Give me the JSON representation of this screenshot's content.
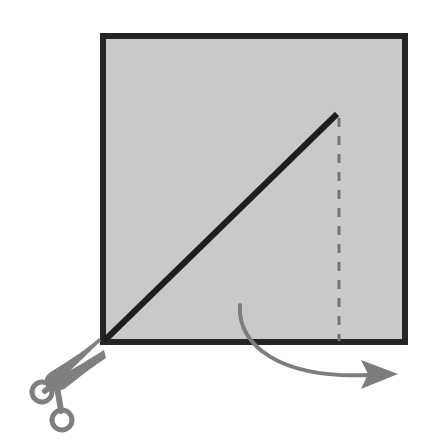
{
  "figure": {
    "name": "paper-fold-and-cut-instruction",
    "type": "diagram",
    "canvas": {
      "width": 423,
      "height": 446,
      "background": "#ffffff"
    }
  },
  "paper_sheet": {
    "shape": "square",
    "fill_color": "#c9c9c9",
    "stroke_color": "#242424",
    "stroke_width": 6,
    "x": 103,
    "y": 36,
    "width": 302,
    "height": 306
  },
  "cut_line": {
    "label": "diagonal cut line",
    "color": "#1e1e1e",
    "stroke_width": 6,
    "from": {
      "x": 104,
      "y": 341
    },
    "to": {
      "x": 337,
      "y": 114
    }
  },
  "fold_line": {
    "label": "dashed fold line",
    "color": "#757575",
    "stroke_width": 3,
    "dash": "9 9",
    "from": {
      "x": 339,
      "y": 118
    },
    "to": {
      "x": 339,
      "y": 341
    }
  },
  "motion_arrow": {
    "label": "fold direction arrow",
    "color": "#7d7d7d",
    "stroke_width": 4,
    "path": "M 240,305 C 238,345 280,378 370,375",
    "arrowhead": {
      "tip": {
        "x": 398,
        "y": 374
      },
      "points": "398,374 361,360 368,374 361,389"
    }
  },
  "scissors": {
    "label": "scissors",
    "icon": "scissors-icon",
    "color": "#7f7f7f",
    "ring_upper": {
      "cx": 42,
      "cy": 392,
      "r": 10,
      "stroke_width": 5
    },
    "ring_lower": {
      "cx": 62,
      "cy": 420,
      "r": 10,
      "stroke_width": 5
    },
    "blade_upper": "M 48,385 C 58,377 68,368 100,343",
    "blade_lower": "M 56,411 C 66,398 78,382 104,357"
  },
  "colors": {
    "paper_fill": "#c9c9c9",
    "paper_border": "#242424",
    "cut_line": "#1e1e1e",
    "fold_line": "#757575",
    "arrow": "#7d7d7d",
    "scissors": "#7f7f7f",
    "background": "#ffffff"
  }
}
